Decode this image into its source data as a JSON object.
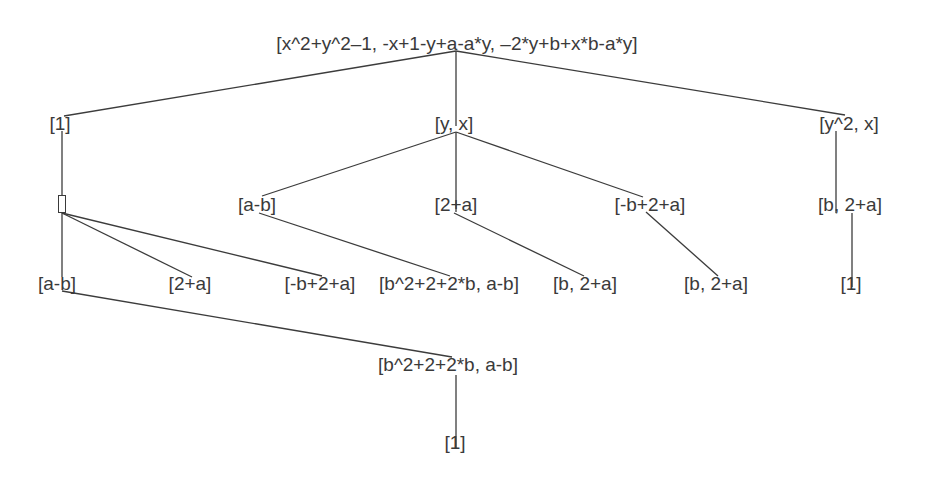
{
  "diagram": {
    "type": "tree",
    "nodes": [
      {
        "id": "root",
        "label": "[x^2+y^2–1, -x+1-y+a-a*y, –2*y+b+x*b-a*y]",
        "x": 457,
        "y": 43
      },
      {
        "id": "n1",
        "label": "[1]",
        "x": 60,
        "y": 123
      },
      {
        "id": "n2",
        "label": "[y, x]",
        "x": 454,
        "y": 123
      },
      {
        "id": "n3",
        "label": "[y^2, x]",
        "x": 849,
        "y": 123
      },
      {
        "id": "n4",
        "label": "",
        "x": 62,
        "y": 204,
        "empty_box": true
      },
      {
        "id": "n5",
        "label": "[a-b]",
        "x": 257,
        "y": 204
      },
      {
        "id": "n6",
        "label": "[2+a]",
        "x": 456,
        "y": 204
      },
      {
        "id": "n7",
        "label": "[-b+2+a]",
        "x": 650,
        "y": 204
      },
      {
        "id": "n8",
        "label": "[b, 2+a]",
        "x": 850,
        "y": 204
      },
      {
        "id": "n9",
        "label": "[a-b]",
        "x": 57,
        "y": 283
      },
      {
        "id": "n10",
        "label": "[2+a]",
        "x": 190,
        "y": 283
      },
      {
        "id": "n11",
        "label": "[-b+2+a]",
        "x": 320,
        "y": 283
      },
      {
        "id": "n12",
        "label": "[b^2+2+2*b, a-b]",
        "x": 449,
        "y": 283
      },
      {
        "id": "n13",
        "label": "[b, 2+a]",
        "x": 585,
        "y": 283
      },
      {
        "id": "n14",
        "label": "[b, 2+a]",
        "x": 716,
        "y": 283
      },
      {
        "id": "n15",
        "label": "[1]",
        "x": 851,
        "y": 283
      },
      {
        "id": "n16",
        "label": "[b^2+2+2*b, a-b]",
        "x": 448,
        "y": 364
      },
      {
        "id": "n17",
        "label": "[1]",
        "x": 455,
        "y": 442
      }
    ],
    "edges": [
      {
        "from": "root",
        "to": "n1",
        "x1": 456,
        "y1": 51,
        "x2": 64,
        "y2": 116
      },
      {
        "from": "root",
        "to": "n2",
        "x1": 456,
        "y1": 51,
        "x2": 456,
        "y2": 126
      },
      {
        "from": "root",
        "to": "n3",
        "x1": 456,
        "y1": 51,
        "x2": 845,
        "y2": 115
      },
      {
        "from": "n1",
        "to": "n4",
        "x1": 62,
        "y1": 131,
        "x2": 62,
        "y2": 195
      },
      {
        "from": "n2",
        "to": "n5",
        "x1": 456,
        "y1": 132,
        "x2": 262,
        "y2": 196
      },
      {
        "from": "n2",
        "to": "n6",
        "x1": 456,
        "y1": 132,
        "x2": 456,
        "y2": 212
      },
      {
        "from": "n2",
        "to": "n7",
        "x1": 456,
        "y1": 132,
        "x2": 643,
        "y2": 197
      },
      {
        "from": "n3",
        "to": "n8",
        "x1": 836,
        "y1": 131,
        "x2": 836,
        "y2": 213
      },
      {
        "from": "n4",
        "to": "n9",
        "x1": 62,
        "y1": 213,
        "x2": 62,
        "y2": 277
      },
      {
        "from": "n4",
        "to": "n10",
        "x1": 62,
        "y1": 213,
        "x2": 192,
        "y2": 277
      },
      {
        "from": "n4",
        "to": "n11",
        "x1": 62,
        "y1": 213,
        "x2": 322,
        "y2": 276
      },
      {
        "from": "n5",
        "to": "n12",
        "x1": 259,
        "y1": 213,
        "x2": 450,
        "y2": 276
      },
      {
        "from": "n6",
        "to": "n13",
        "x1": 454,
        "y1": 213,
        "x2": 584,
        "y2": 276
      },
      {
        "from": "n7",
        "to": "n14",
        "x1": 646,
        "y1": 212,
        "x2": 718,
        "y2": 276
      },
      {
        "from": "n8",
        "to": "n15",
        "x1": 852,
        "y1": 213,
        "x2": 852,
        "y2": 287
      },
      {
        "from": "n9",
        "to": "n16",
        "x1": 62,
        "y1": 291,
        "x2": 452,
        "y2": 357
      },
      {
        "from": "n16",
        "to": "n17",
        "x1": 456,
        "y1": 375,
        "x2": 456,
        "y2": 448
      }
    ]
  }
}
